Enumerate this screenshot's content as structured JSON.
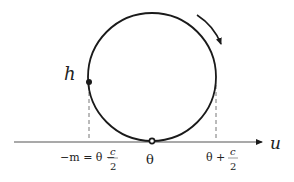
{
  "diagram": {
    "type": "circle-on-axis",
    "colors": {
      "stroke": "#1a1a1a",
      "dashed": "#777777",
      "axis": "#555555"
    },
    "circle": {
      "cx": 152,
      "cy": 77,
      "r": 64
    },
    "point_label": "h",
    "axis_label": "u",
    "ticks": {
      "left": {
        "prefix": "−m = θ −",
        "frac_num": "c",
        "frac_den": "2"
      },
      "center": {
        "label": "θ"
      },
      "right": {
        "prefix": "θ +",
        "frac_num": "c",
        "frac_den": "2"
      }
    },
    "rotation": "clockwise"
  }
}
